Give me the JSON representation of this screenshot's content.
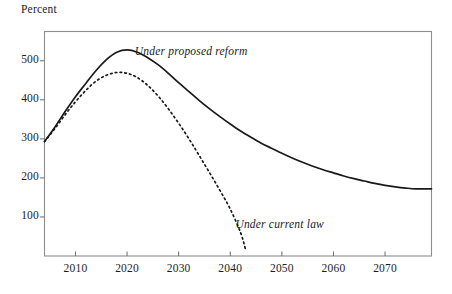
{
  "chart_data": {
    "type": "line",
    "title": "",
    "subtitle": "",
    "ylabel": "Percent",
    "xlabel": "",
    "xlim": [
      2004,
      2079
    ],
    "ylim": [
      0,
      575
    ],
    "grid": false,
    "legend_position": "inline-annotation",
    "yticks": [
      100,
      200,
      300,
      400,
      500
    ],
    "xticks": [
      2010,
      2020,
      2030,
      2040,
      2050,
      2060,
      2070
    ],
    "ytick_labels": [
      "100",
      "200",
      "300",
      "400",
      "500"
    ],
    "xtick_labels": [
      "2010",
      "2020",
      "2030",
      "2040",
      "2050",
      "2060",
      "2070"
    ],
    "series": [
      {
        "name": "Under proposed reform",
        "style": "solid",
        "color": "#1a1a1a",
        "annotation": "Under proposed reform",
        "x": [
          2004,
          2006,
          2008,
          2010,
          2012,
          2014,
          2016,
          2018,
          2020,
          2022,
          2024,
          2026,
          2028,
          2030,
          2032,
          2034,
          2036,
          2038,
          2040,
          2042,
          2044,
          2046,
          2048,
          2050,
          2052,
          2054,
          2056,
          2058,
          2060,
          2062,
          2064,
          2066,
          2068,
          2070,
          2072,
          2074,
          2076,
          2079
        ],
        "values": [
          293,
          330,
          370,
          408,
          442,
          475,
          503,
          522,
          528,
          522,
          508,
          490,
          468,
          444,
          421,
          398,
          377,
          357,
          338,
          320,
          304,
          289,
          276,
          263,
          251,
          240,
          230,
          221,
          213,
          205,
          198,
          192,
          186,
          181,
          177,
          174,
          172,
          172
        ]
      },
      {
        "name": "Under current law",
        "style": "dotted",
        "color": "#1a1a1a",
        "annotation": "Under current law",
        "x": [
          2004,
          2006,
          2008,
          2010,
          2012,
          2014,
          2016,
          2018,
          2020,
          2022,
          2024,
          2026,
          2028,
          2030,
          2032,
          2034,
          2036,
          2038,
          2040,
          2042,
          2043
        ],
        "values": [
          293,
          326,
          362,
          395,
          424,
          448,
          463,
          470,
          468,
          457,
          437,
          410,
          377,
          340,
          300,
          257,
          213,
          168,
          120,
          60,
          15
        ]
      }
    ]
  },
  "annotations": {
    "proposed_reform": "Under proposed reform",
    "current_law": "Under current law"
  }
}
